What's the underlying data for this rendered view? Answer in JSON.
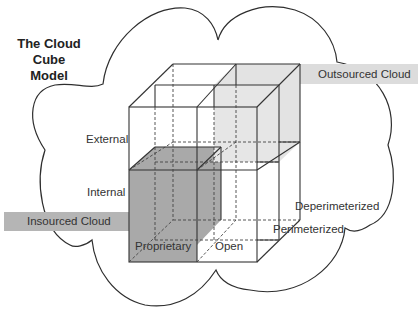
{
  "title": {
    "line1": "The Cloud Cube",
    "line2": "Model"
  },
  "bands": {
    "outsourced": {
      "label": "Outsourced Cloud",
      "color": "#d9d9d9"
    },
    "insourced": {
      "label": "Insourced Cloud",
      "color": "#b3b3b3"
    }
  },
  "axes": {
    "vertical": {
      "top": "External",
      "bottom": "Internal"
    },
    "horizontal": {
      "left": "Proprietary",
      "right": "Open"
    },
    "depth": {
      "back": "Deperimeterized",
      "front": "Perimeterized"
    }
  },
  "colors": {
    "insourced_fill": "#a8a8a8",
    "outsourced_fill": "#e2e2e2",
    "line": "#333333"
  }
}
